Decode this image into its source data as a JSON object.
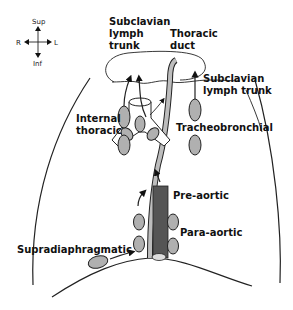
{
  "compass": {
    "sup": "Sup",
    "inf": "Inf",
    "right": "R",
    "left": "L"
  },
  "labels": {
    "subclavian_left": [
      "Subclavian",
      "lymph",
      "trunk"
    ],
    "thoracic_duct": [
      "Thoracic",
      "duct"
    ],
    "subclavian_right": [
      "Subclavian",
      "lymph trunk"
    ],
    "internal_thoracic": [
      "Internal",
      "thoracic"
    ],
    "tracheobronchial": "Tracheobronchial",
    "pre_aortic": "Pre-aortic",
    "para_aortic": "Para-aortic",
    "supradiaphragmatic": "Supradiaphragmatic"
  },
  "colors": {
    "node_fill": "#b0b0b0",
    "aorta_fill": "#555555",
    "duct_fill": "#bdbdbd",
    "outline": "#222222"
  }
}
